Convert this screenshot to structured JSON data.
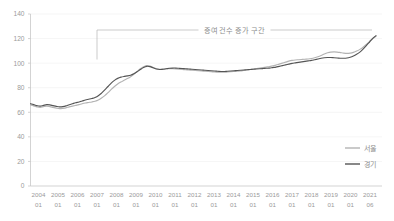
{
  "chart_data": {
    "type": "line",
    "title": "",
    "subtitle": "",
    "xlabel": "",
    "ylabel": "",
    "ylim": [
      0,
      140
    ],
    "yticks": [
      0,
      20,
      40,
      60,
      80,
      100,
      120,
      140
    ],
    "ytick_labels": [
      "0",
      "20",
      "40",
      "60",
      "80",
      "100",
      "120",
      "140"
    ],
    "grid": true,
    "legend_position": "right-middle",
    "annotations": [
      {
        "text": "증여 건수 증가 구간",
        "type": "bracket-span",
        "start_x": "2007 01",
        "end_x": "2021 06",
        "y_level": 127
      }
    ],
    "xtick_labels": [
      "2004\n01",
      "2005\n01",
      "2006\n01",
      "2007\n01",
      "2008\n01",
      "2009\n01",
      "2010\n01",
      "2011\n01",
      "2012\n01",
      "2013\n01",
      "2014\n01",
      "2015\n01",
      "2016\n01",
      "2017\n01",
      "2018\n01",
      "2019\n01",
      "2020\n01",
      "2021\n06"
    ],
    "xticks_year": [
      "2004",
      "2005",
      "2006",
      "2007",
      "2008",
      "2009",
      "2010",
      "2011",
      "2012",
      "2013",
      "2014",
      "2015",
      "2016",
      "2017",
      "2018",
      "2019",
      "2020",
      "2021"
    ],
    "xticks_month": [
      "01",
      "01",
      "01",
      "01",
      "01",
      "01",
      "01",
      "01",
      "01",
      "01",
      "01",
      "01",
      "01",
      "01",
      "01",
      "01",
      "01",
      "06"
    ],
    "series": [
      {
        "name": "서울",
        "color": "#b3b3b3",
        "values": [
          66.0,
          65.2,
          64.4,
          64.0,
          64.6,
          65.0,
          64.6,
          64.0,
          63.4,
          63.0,
          63.2,
          63.6,
          64.4,
          65.0,
          65.6,
          66.2,
          67.0,
          67.6,
          68.0,
          68.4,
          69.0,
          70.0,
          71.6,
          73.6,
          76.0,
          78.6,
          81.0,
          83.0,
          84.6,
          86.0,
          87.4,
          89.0,
          91.0,
          93.2,
          95.4,
          97.0,
          98.0,
          97.6,
          96.4,
          95.4,
          95.0,
          95.2,
          95.4,
          95.6,
          95.4,
          95.2,
          95.0,
          94.8,
          94.6,
          94.4,
          94.2,
          94.0,
          93.8,
          93.6,
          93.4,
          93.2,
          93.0,
          92.8,
          92.7,
          92.6,
          92.6,
          92.8,
          93.0,
          93.2,
          93.4,
          93.6,
          94.0,
          94.4,
          94.8,
          95.2,
          95.6,
          96.0,
          96.4,
          96.8,
          97.2,
          97.8,
          98.4,
          99.2,
          100.0,
          100.8,
          101.6,
          102.2,
          102.6,
          102.8,
          103.0,
          103.2,
          103.4,
          103.8,
          104.4,
          105.2,
          106.2,
          107.4,
          108.4,
          109.0,
          109.2,
          109.0,
          108.6,
          108.2,
          108.0,
          108.2,
          108.8,
          109.8,
          111.2,
          113.0,
          115.2,
          117.6,
          120.0,
          121.8
        ]
      },
      {
        "name": "경기",
        "color": "#555555",
        "values": [
          67.0,
          66.2,
          65.4,
          65.0,
          65.6,
          66.2,
          66.0,
          65.4,
          64.8,
          64.4,
          64.6,
          65.2,
          66.2,
          67.0,
          67.8,
          68.4,
          69.2,
          70.0,
          70.6,
          71.2,
          72.0,
          73.4,
          75.6,
          78.2,
          81.0,
          83.8,
          86.0,
          87.6,
          88.6,
          89.2,
          89.6,
          90.2,
          91.4,
          93.0,
          94.8,
          96.4,
          97.4,
          97.2,
          96.2,
          95.2,
          94.8,
          95.0,
          95.4,
          95.8,
          96.0,
          96.0,
          95.8,
          95.6,
          95.4,
          95.2,
          95.0,
          94.8,
          94.6,
          94.4,
          94.2,
          94.0,
          93.8,
          93.6,
          93.4,
          93.2,
          93.2,
          93.4,
          93.6,
          93.8,
          94.0,
          94.2,
          94.4,
          94.6,
          94.8,
          95.0,
          95.2,
          95.4,
          95.6,
          95.8,
          96.0,
          96.4,
          96.8,
          97.4,
          98.0,
          98.6,
          99.2,
          99.8,
          100.2,
          100.6,
          101.0,
          101.4,
          101.8,
          102.2,
          102.8,
          103.4,
          104.0,
          104.4,
          104.6,
          104.6,
          104.4,
          104.2,
          104.0,
          104.0,
          104.2,
          104.8,
          105.8,
          107.2,
          109.0,
          111.4,
          114.2,
          117.2,
          120.2,
          122.4
        ]
      }
    ]
  },
  "legend": {
    "items": [
      {
        "label": "서울",
        "color": "#b3b3b3"
      },
      {
        "label": "경기",
        "color": "#555555"
      }
    ]
  },
  "annotation": {
    "label": "증여 건수 증가 구간"
  },
  "colors": {
    "seoul_line": "#b3b3b3",
    "gyeonggi_line": "#555555",
    "gridline": "#f0f0f0",
    "axis": "#c8c8c8",
    "tick_text": "#9a9a9a",
    "annotation_text": "#8d8d8d",
    "background": "#ffffff"
  }
}
